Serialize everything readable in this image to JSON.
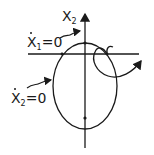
{
  "diagram": {
    "type": "phase-plane sketch",
    "axis_label_vertical": "X",
    "axis_label_vertical_sub": "2",
    "nullcline_1_label": "X",
    "nullcline_1_sub": "1",
    "nullcline_1_rhs": "=0",
    "nullcline_2_label": "X",
    "nullcline_2_sub": "2",
    "nullcline_2_rhs": "=0",
    "stroke_color": "#1a1a1a"
  }
}
